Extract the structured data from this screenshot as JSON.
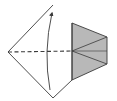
{
  "diagram": {
    "type": "origami-fold-step",
    "colors": {
      "background": "#ffffff",
      "outline": "#3a3a3a",
      "shade": "#b8b8b8",
      "arrow": "#3a3a3a"
    },
    "shapes": {
      "outline_points": "53,5 8,52 53,98 72,80 72,23",
      "shaded_flap_points": "72,23 107,37 107,64 72,80",
      "flap_creases": [
        {
          "x1": 72,
          "y1": 51,
          "x2": 107,
          "y2": 37
        },
        {
          "x1": 72,
          "y1": 51,
          "x2": 107,
          "y2": 51
        },
        {
          "x1": 72,
          "y1": 51,
          "x2": 107,
          "y2": 64
        }
      ],
      "fold_line": {
        "x1": 8,
        "y1": 52,
        "x2": 72,
        "y2": 51,
        "style": "dashed"
      },
      "arrow_path": "M50,90 Q43,52 52,13"
    }
  }
}
